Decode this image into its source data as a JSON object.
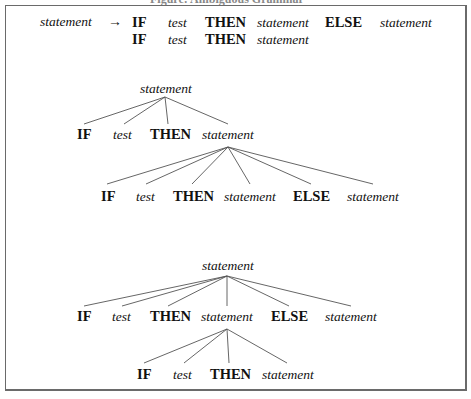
{
  "caption": "Figure: Ambiguous Grammar",
  "rule": {
    "lhs": "statement",
    "arrow": "→",
    "alt1": [
      "IF",
      "test",
      "THEN",
      "statement",
      "ELSE",
      "statement"
    ],
    "alt2": [
      "IF",
      "test",
      "THEN",
      "statement"
    ]
  },
  "tree1": {
    "root": "statement",
    "level2": [
      "IF",
      "test",
      "THEN",
      "statement"
    ],
    "level3": [
      "IF",
      "test",
      "THEN",
      "statement",
      "ELSE",
      "statement"
    ]
  },
  "tree2": {
    "root": "statement",
    "level2": [
      "IF",
      "test",
      "THEN",
      "statement",
      "ELSE",
      "statement"
    ],
    "level3": [
      "IF",
      "test",
      "THEN",
      "statement"
    ]
  },
  "colors": {
    "line": "#555555",
    "frame": "#6a6a6a",
    "text": "#111111"
  }
}
